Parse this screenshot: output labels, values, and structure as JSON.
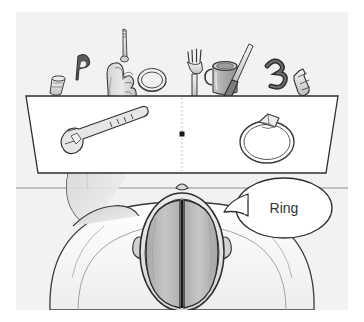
{
  "figure": {
    "kind": "illustration",
    "title_text": "",
    "background_color": "#ffffff",
    "panel_background_color": "#f2f2f2",
    "line_color": "#3a3a3a",
    "ink_color": "#222222"
  },
  "speech_bubble": {
    "text": "Ring",
    "text_color": "#333333",
    "fill_color": "#ffffff"
  },
  "screen": {
    "name": "tachistoscope-screen",
    "fill_color": "#ffffff",
    "divider_style": "dotted",
    "fixation_dot_color": "#1a1a1a",
    "left_field": {
      "object": "key",
      "label": "key",
      "fill_color": "#e6e6e6"
    },
    "right_field": {
      "object": "diamond-ring",
      "label": "ring",
      "fill_color": "#ededed"
    }
  },
  "object_row": {
    "name": "object-array-behind-screen",
    "items": [
      {
        "label": "thimble",
        "icon": "thimble-object"
      },
      {
        "label": "letter P",
        "icon": "letter-p-object"
      },
      {
        "label": "hand holding key",
        "icon": "hand-holding-key"
      },
      {
        "label": "ring band",
        "icon": "ring-band-object"
      },
      {
        "label": "fork",
        "icon": "fork-object"
      },
      {
        "label": "mug",
        "icon": "mug-object"
      },
      {
        "label": "screwdriver",
        "icon": "screwdriver-object"
      },
      {
        "label": "numeral 3",
        "icon": "numeral-3-object"
      },
      {
        "label": "small bottle",
        "icon": "small-bottle-object"
      }
    ]
  },
  "subject": {
    "name": "participant",
    "view": "top-down",
    "brain": {
      "label": "brain",
      "left_hemisphere_label": "left hemisphere",
      "right_hemisphere_label": "right hemisphere",
      "fill_color": "#b9b9b9",
      "midline_color": "#1d1d1d"
    },
    "body": {
      "shoulders_fill": "#fbfbfb",
      "arm_fill": "#d8d8d8",
      "skin_fill": "#e3e3e3"
    }
  }
}
